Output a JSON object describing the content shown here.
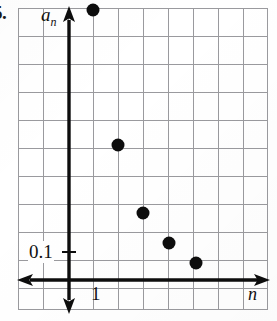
{
  "problem": {
    "number_label": "5."
  },
  "figure": {
    "y_axis_label": "a",
    "y_axis_label_sub": "n",
    "x_axis_label": "n",
    "y_tick_label": "0.1",
    "x_tick_label": "1"
  },
  "chart_data": {
    "type": "scatter",
    "title": "",
    "xlabel": "n",
    "ylabel": "a_n",
    "x": [
      1,
      2,
      3,
      4,
      5
    ],
    "values": [
      0.5,
      0.24,
      0.155,
      0.125,
      0.105
    ],
    "point_labels": [
      "",
      "",
      "",
      "",
      ""
    ],
    "xlim": [
      0,
      8
    ],
    "ylim": [
      0,
      0.5
    ],
    "grid": true,
    "legend": false,
    "annotations": [
      "0.1",
      "1"
    ],
    "y_tick_values": [
      0.1
    ],
    "x_tick_values": [
      1
    ]
  },
  "geometry": {
    "grid": {
      "left": 18,
      "top": 8,
      "width": 250,
      "height": 302,
      "cell_w": 25,
      "cell_h": 28
    },
    "y_axis_x": 69,
    "x_axis_y": 280,
    "points_px": [
      {
        "x": 93,
        "y": 10
      },
      {
        "x": 118,
        "y": 145
      },
      {
        "x": 143,
        "y": 213
      },
      {
        "x": 169,
        "y": 243
      },
      {
        "x": 196,
        "y": 263
      }
    ]
  },
  "colors": {
    "grid_line": "#9a9a9e",
    "axis": "#0d0d0d",
    "point": "#0d0d0d",
    "text": "#111111",
    "background": "#ffffff"
  }
}
